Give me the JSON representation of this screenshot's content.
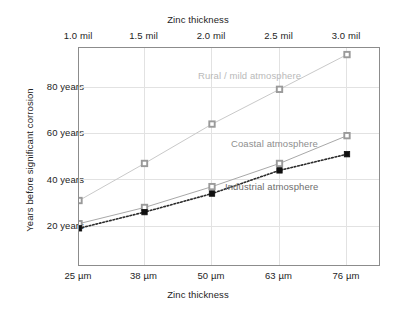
{
  "chart_data": {
    "type": "line",
    "title": "",
    "top_axis": {
      "label": "Zinc thickness",
      "ticks": [
        "1.0 mil",
        "1.5 mil",
        "2.0 mil",
        "2.5 mil",
        "3.0 mil"
      ],
      "values": [
        1.0,
        1.5,
        2.0,
        2.5,
        3.0
      ]
    },
    "xlabel": "Zinc thickness",
    "x_ticks": [
      "25 µm",
      "38 µm",
      "50 µm",
      "63 µm",
      "76 µm"
    ],
    "x": [
      25,
      38,
      50,
      63,
      76
    ],
    "ylabel": "Years before significant corrosion",
    "y_ticks": [
      "20 years",
      "40 years",
      "60 years",
      "80 years"
    ],
    "y_tick_values": [
      20,
      40,
      60,
      80
    ],
    "ylim": [
      2,
      97
    ],
    "grid": true,
    "legend_position": "inline-annotations",
    "series": [
      {
        "name": "Rural / mild atmosphere",
        "label_color": "#b9b9b9",
        "line_color": "#c9c9c9",
        "marker": "open-square",
        "marker_fill": "#9a9a9a",
        "line_style": "solid",
        "values": [
          31,
          47,
          64,
          79,
          94
        ]
      },
      {
        "name": "Coastal atmosphere",
        "label_color": "#8e8e8e",
        "line_color": "#a8a8a8",
        "marker": "open-square",
        "marker_fill": "#9a9a9a",
        "line_style": "solid",
        "values": [
          21,
          28,
          37,
          47,
          59
        ]
      },
      {
        "name": "Industrial atmosphere",
        "label_color": "#6e6e6e",
        "line_color": "#2b2b2b",
        "marker": "filled-square",
        "marker_fill": "#101010",
        "line_style": "dotted",
        "values": [
          19,
          26,
          34,
          44,
          51
        ]
      }
    ],
    "colors": {
      "frame": "#8c8c8c",
      "grid": "#e2e2e2",
      "text": "#242424",
      "background": "#ffffff"
    }
  }
}
